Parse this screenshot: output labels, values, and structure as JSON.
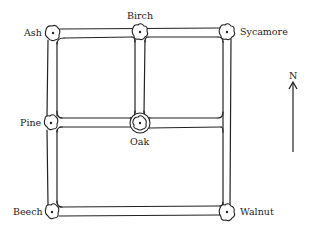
{
  "diagram": {
    "type": "street map",
    "trees": [
      {
        "name": "Ash",
        "x": 53,
        "y": 33
      },
      {
        "name": "Birch",
        "x": 140,
        "y": 32
      },
      {
        "name": "Sycamore",
        "x": 227,
        "y": 32
      },
      {
        "name": "Pine",
        "x": 51,
        "y": 123
      },
      {
        "name": "Oak",
        "x": 140,
        "y": 123
      },
      {
        "name": "Beech",
        "x": 52,
        "y": 212
      },
      {
        "name": "Walnut",
        "x": 227,
        "y": 212
      }
    ],
    "labels": {
      "ash": "Ash",
      "birch": "Birch",
      "sycamore": "Sycamore",
      "pine": "Pine",
      "oak": "Oak",
      "beech": "Beech",
      "walnut": "Walnut"
    },
    "compass": {
      "label": "N"
    },
    "colors": {
      "ink": "#222222",
      "background": "#ffffff"
    }
  }
}
